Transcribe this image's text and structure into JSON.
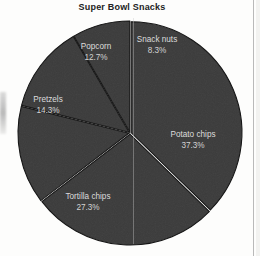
{
  "chart_data": {
    "type": "pie",
    "title": "Super Bowl Snacks",
    "xlabel": "",
    "ylabel": "",
    "legend_position": "none",
    "grid": false,
    "labels_on_slices": true,
    "start_angle_deg": 0,
    "direction": "clockwise",
    "categories": [
      "Potato chips",
      "Tortilla chips",
      "Pretzels",
      "Popcorn",
      "Snack nuts"
    ],
    "values": [
      37.3,
      27.3,
      14.3,
      12.7,
      8.3
    ],
    "value_unit": "%",
    "slices": [
      {
        "name": "Potato chips",
        "label": "Potato chips",
        "percent_text": "37.3%",
        "value": 37.3,
        "start_deg": 0,
        "end_deg": 134.28,
        "label_x": 193,
        "label_y": 137,
        "pct_x": 193,
        "pct_y": 148
      },
      {
        "name": "Tortilla chips",
        "label": "Tortilla chips",
        "percent_text": "27.3%",
        "value": 27.3,
        "start_deg": 134.28,
        "end_deg": 232.56,
        "label_x": 88,
        "label_y": 199,
        "pct_x": 88,
        "pct_y": 210
      },
      {
        "name": "Pretzels",
        "label": "Pretzels",
        "percent_text": "14.3%",
        "value": 14.3,
        "start_deg": 232.56,
        "end_deg": 284.04,
        "label_x": 48,
        "label_y": 102,
        "pct_x": 48,
        "pct_y": 113
      },
      {
        "name": "Popcorn",
        "label": "Popcorn",
        "percent_text": "12.7%",
        "value": 12.7,
        "start_deg": 284.04,
        "end_deg": 329.76,
        "label_x": 96,
        "label_y": 49,
        "pct_x": 96,
        "pct_y": 60
      },
      {
        "name": "Snack nuts",
        "label": "Snack nuts",
        "percent_text": "8.3%",
        "value": 8.3,
        "start_deg": 329.76,
        "end_deg": 360,
        "label_x": 157,
        "label_y": 42,
        "pct_x": 157,
        "pct_y": 53
      }
    ],
    "colors": {
      "slice_fill": "#3b3b3b",
      "slice_stroke": "#141414",
      "label_text": "#dcdcdc",
      "title_text": "#222222",
      "background": "#fdfdfc"
    },
    "geometry": {
      "center_x": 130,
      "center_y": 133,
      "radius": 112
    }
  }
}
